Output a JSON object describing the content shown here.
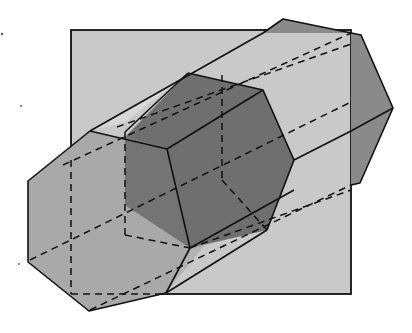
{
  "figure": {
    "type": "geometric-diagram",
    "colors": {
      "background": "#ffffff",
      "square_fill": "#c9c9c9",
      "front_hex_fill": "#a9a9a9",
      "back_hex_fill": "#8a8a8a",
      "cross_section_fill": "#6f6f6f",
      "lower_face_fill": "#8c8c8c",
      "stroke": "#111111"
    },
    "square": {
      "x": 71,
      "y": 30,
      "width": 280,
      "height": 264
    },
    "front_hexagon": [
      [
        28,
        181
      ],
      [
        90,
        131
      ],
      [
        125,
        122
      ],
      [
        125,
        140
      ],
      [
        166,
        293
      ],
      [
        89,
        311
      ],
      [
        28,
        262
      ]
    ],
    "back_hexagon": [
      [
        263,
        33
      ],
      [
        283,
        19
      ],
      [
        361,
        35
      ],
      [
        393,
        108
      ],
      [
        360,
        183
      ],
      [
        351,
        185
      ]
    ],
    "cross_section_hexagon": [
      [
        125,
        137
      ],
      [
        188,
        73
      ],
      [
        263,
        90
      ],
      [
        294,
        160
      ],
      [
        267,
        230
      ],
      [
        190,
        248
      ],
      [
        125,
        200
      ]
    ],
    "labels": []
  }
}
